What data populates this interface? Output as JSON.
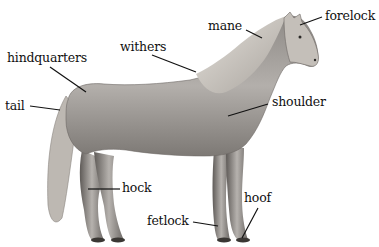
{
  "diagram": {
    "colors": {
      "background": "#ffffff",
      "label_text": "#111111",
      "leader_line": "#111111",
      "horse_body": "#a8a4a0",
      "mane": "#cfcac3"
    },
    "labels": [
      {
        "id": "mane",
        "text": "mane",
        "x": 208,
        "y": 20,
        "line": [
          246,
          30,
          262,
          38
        ]
      },
      {
        "id": "forelock",
        "text": "forelock",
        "x": 325,
        "y": 10,
        "line": [
          322,
          17,
          300,
          25
        ]
      },
      {
        "id": "withers",
        "text": "withers",
        "x": 120,
        "y": 41,
        "line": [
          152,
          55,
          196,
          72
        ]
      },
      {
        "id": "hindquarters",
        "text": "hindquarters",
        "x": 7,
        "y": 52,
        "line": [
          50,
          67,
          86,
          92
        ]
      },
      {
        "id": "shoulder",
        "text": "shoulder",
        "x": 272,
        "y": 96,
        "line": [
          268,
          104,
          228,
          116
        ]
      },
      {
        "id": "tail",
        "text": "tail",
        "x": 5,
        "y": 100,
        "line": [
          30,
          106,
          60,
          110
        ]
      },
      {
        "id": "hock",
        "text": "hock",
        "x": 122,
        "y": 182,
        "line": [
          120,
          189,
          88,
          189
        ]
      },
      {
        "id": "fetlock",
        "text": "fetlock",
        "x": 147,
        "y": 215,
        "line": [
          193,
          222,
          218,
          226
        ]
      },
      {
        "id": "hoof",
        "text": "hoof",
        "x": 244,
        "y": 192,
        "line": [
          258,
          208,
          242,
          238
        ]
      }
    ]
  }
}
